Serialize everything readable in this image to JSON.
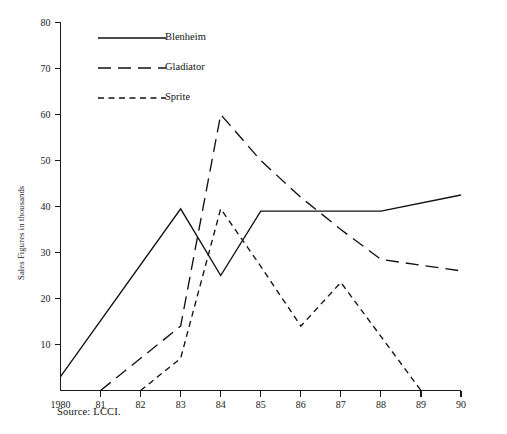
{
  "figure": {
    "top_caption": "",
    "source_note": "Source: LCCI.",
    "background_color": "#ffffff",
    "line_color": "#111111"
  },
  "axes": {
    "y_title": "Sales Figures in thousands",
    "y_ticks": [
      "80",
      "70",
      "60",
      "50",
      "40",
      "30",
      "20",
      "10"
    ],
    "x_ticks": [
      "1980",
      "81",
      "82",
      "83",
      "84",
      "85",
      "86",
      "87",
      "88",
      "89",
      "90"
    ]
  },
  "legend": {
    "position": "top-left-inside",
    "items": [
      {
        "label": "Blenheim",
        "style": "solid"
      },
      {
        "label": "Gladiator",
        "style": "long-dash"
      },
      {
        "label": "Sprite",
        "style": "short-dash"
      }
    ]
  },
  "chart_data": {
    "type": "line",
    "title": "",
    "xlabel": "",
    "ylabel": "Sales Figures in thousands",
    "xlim": [
      1980,
      1990
    ],
    "ylim": [
      0,
      80
    ],
    "grid": false,
    "legend_position": "upper left",
    "x": [
      1980,
      1981,
      1982,
      1983,
      1984,
      1985,
      1986,
      1987,
      1988,
      1989,
      1990
    ],
    "x_tick_labels": [
      "1980",
      "81",
      "82",
      "83",
      "84",
      "85",
      "86",
      "87",
      "88",
      "89",
      "90"
    ],
    "y_ticks": [
      10,
      20,
      30,
      40,
      50,
      60,
      70,
      80
    ],
    "series": [
      {
        "name": "Blenheim",
        "style": "solid",
        "points": [
          {
            "x": 1980,
            "y": 3
          },
          {
            "x": 1983,
            "y": 39.5
          },
          {
            "x": 1984,
            "y": 25
          },
          {
            "x": 1985,
            "y": 39
          },
          {
            "x": 1986,
            "y": 39
          },
          {
            "x": 1987,
            "y": 39
          },
          {
            "x": 1988,
            "y": 39
          },
          {
            "x": 1990,
            "y": 42.5
          }
        ]
      },
      {
        "name": "Gladiator",
        "style": "long-dash",
        "points": [
          {
            "x": 1981,
            "y": 0
          },
          {
            "x": 1983,
            "y": 14
          },
          {
            "x": 1984,
            "y": 60
          },
          {
            "x": 1985,
            "y": 50
          },
          {
            "x": 1986,
            "y": 42
          },
          {
            "x": 1987,
            "y": 35
          },
          {
            "x": 1988,
            "y": 28.5
          },
          {
            "x": 1990,
            "y": 26
          }
        ]
      },
      {
        "name": "Sprite",
        "style": "short-dash",
        "points": [
          {
            "x": 1982,
            "y": 0
          },
          {
            "x": 1983,
            "y": 7
          },
          {
            "x": 1984,
            "y": 39.5
          },
          {
            "x": 1985,
            "y": 27
          },
          {
            "x": 1986,
            "y": 14
          },
          {
            "x": 1987,
            "y": 23.5
          },
          {
            "x": 1989,
            "y": 0
          }
        ]
      }
    ]
  }
}
